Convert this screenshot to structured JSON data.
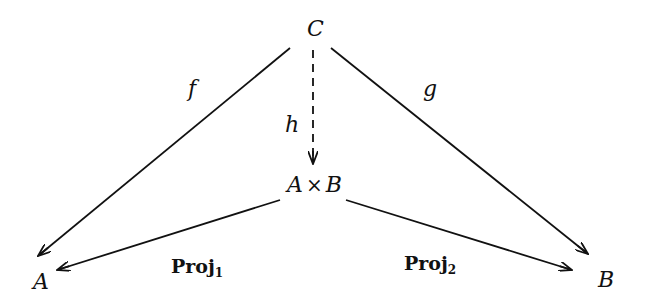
{
  "diagram": {
    "type": "commutative-diagram",
    "nodes": {
      "C": {
        "label": "C"
      },
      "product": {
        "left": "A",
        "op": "×",
        "right": "B"
      },
      "A": {
        "label": "A"
      },
      "B": {
        "label": "B"
      }
    },
    "arrows": {
      "f": {
        "label": "f",
        "from": "C",
        "to": "A",
        "style": "solid"
      },
      "g": {
        "label": "g",
        "from": "C",
        "to": "B",
        "style": "solid"
      },
      "h": {
        "label": "h",
        "from": "C",
        "to": "A × B",
        "style": "dashed"
      },
      "proj1": {
        "label": "Proj",
        "subscript": "1",
        "from": "A × B",
        "to": "A",
        "style": "solid"
      },
      "proj2": {
        "label": "Proj",
        "subscript": "2",
        "from": "A × B",
        "to": "B",
        "style": "solid"
      }
    },
    "colors": {
      "stroke": "#111111",
      "background": "#ffffff"
    }
  }
}
